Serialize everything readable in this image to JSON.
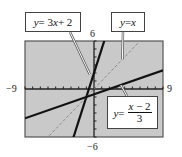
{
  "chart_data": {
    "type": "line",
    "title": "",
    "xlabel": "",
    "ylabel": "",
    "xlim": [
      -9,
      9
    ],
    "ylim": [
      -6,
      6
    ],
    "grid": false,
    "background": "#c9c9c9",
    "tick_labels": {
      "xmin": "−9",
      "xmax": "9",
      "ymax": "6",
      "ymin": "−6"
    },
    "series": [
      {
        "name": "y = 3x + 2",
        "slope": 3,
        "intercept": 2,
        "style": "solid",
        "color": "#111111",
        "width": 2.2
      },
      {
        "name": "y = x",
        "slope": 1,
        "intercept": 0,
        "style": "dashed",
        "color": "#8a8a8a",
        "width": 1
      },
      {
        "name": "y = (x − 2)/3",
        "slope": 0.3333,
        "intercept": -0.6667,
        "style": "solid",
        "color": "#111111",
        "width": 2.2
      }
    ],
    "annotations": [
      {
        "text": "y = 3x + 2",
        "points_to": "line y=3x+2"
      },
      {
        "text": "y = x",
        "points_to": "line y=x"
      },
      {
        "text": "y = (x − 2)/3",
        "points_to": "line y=(x-2)/3"
      }
    ]
  },
  "labels": {
    "line1": {
      "lhs": "y",
      "eq": " = 3",
      "x": "x",
      "rest": " + 2"
    },
    "line2": {
      "lhs": "y",
      "eq": " = ",
      "x": "x"
    },
    "line3": {
      "lhs": "y",
      "eq": " =",
      "num_x": "x",
      "num_rest": " − 2",
      "den": "3"
    }
  },
  "ticks": {
    "xmin": "−9",
    "xmax": "9",
    "ymax": "6",
    "ymin": "−6"
  }
}
